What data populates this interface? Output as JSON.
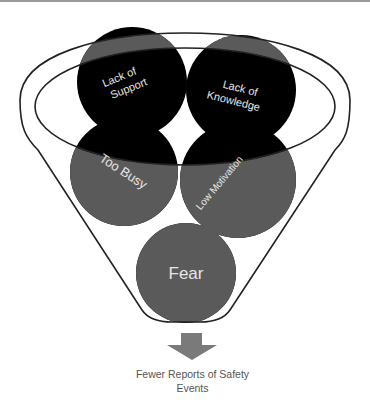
{
  "diagram": {
    "type": "funnel",
    "colors": {
      "outside": "#000000",
      "inside": "#5a5a5a",
      "outline": "#222222",
      "arrow": "#7a7a7a",
      "label": "#e6e6e6",
      "caption": "#555555",
      "top_strip": "#9a9a9a"
    },
    "circles": [
      {
        "id": "lack-of-support",
        "line1": "Lack of",
        "line2": "Support"
      },
      {
        "id": "lack-of-knowledge",
        "line1": "Lack of",
        "line2": "Knowledge"
      },
      {
        "id": "too-busy",
        "label": "Too Busy"
      },
      {
        "id": "low-motivation",
        "label": "Low Motivation"
      },
      {
        "id": "fear",
        "label": "Fear"
      }
    ],
    "output": {
      "caption_line1": "Fewer Reports of Safety",
      "caption_line2": "Events"
    }
  }
}
